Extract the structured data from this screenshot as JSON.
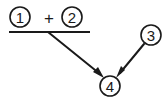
{
  "diagram": {
    "type": "node-arrow-diagram",
    "background_color": "#ffffff",
    "ink_color": "#1a1a1a",
    "nodes": [
      {
        "id": "node-1",
        "label": "1",
        "shape": "circle",
        "cx": 20,
        "cy": 17,
        "r": 10
      },
      {
        "id": "node-2",
        "label": "2",
        "shape": "circle",
        "cx": 72,
        "cy": 17,
        "r": 10
      },
      {
        "id": "node-3",
        "label": "3",
        "shape": "circle",
        "cx": 151,
        "cy": 35,
        "r": 10
      },
      {
        "id": "node-4",
        "label": "4",
        "shape": "circle",
        "cx": 110,
        "cy": 86,
        "r": 10
      }
    ],
    "operators": [
      {
        "id": "plus-operator",
        "label": "+",
        "cx": 49,
        "cy": 18
      }
    ],
    "rules": [
      {
        "id": "sum-rule",
        "x1": 9,
        "y1": 32,
        "x2": 90,
        "y2": 32
      }
    ],
    "arrows": [
      {
        "id": "arrow-sum-to-4",
        "from": "sum-rule",
        "to": "node-4",
        "x1": 48,
        "y1": 32,
        "x2": 103,
        "y2": 77
      },
      {
        "id": "arrow-3-to-4",
        "from": "node-3",
        "to": "node-4",
        "x1": 144,
        "y1": 44,
        "x2": 117,
        "y2": 77
      }
    ]
  }
}
